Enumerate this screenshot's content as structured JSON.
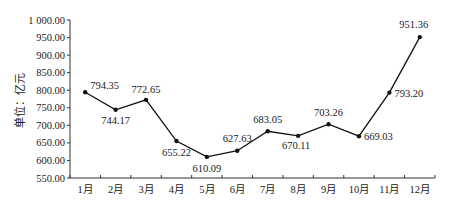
{
  "chart_data": {
    "type": "line",
    "title": "",
    "xlabel": "",
    "ylabel": "单位：亿元",
    "categories": [
      "1月",
      "2月",
      "3月",
      "4月",
      "5月",
      "6月",
      "7月",
      "8月",
      "9月",
      "10月",
      "11月",
      "12月"
    ],
    "series": [
      {
        "name": "",
        "values": [
          794.35,
          744.17,
          772.65,
          655.22,
          610.09,
          627.63,
          683.05,
          670.11,
          703.26,
          669.03,
          793.2,
          951.36
        ]
      }
    ],
    "data_labels": [
      "794.35",
      "744.17",
      "772.65",
      "655.22",
      "610.09",
      "627.63",
      "683.05",
      "670.11",
      "703.26",
      "669.03",
      "793.20",
      "951.36"
    ],
    "yticks": [
      "550.00",
      "600.00",
      "650.00",
      "700.00",
      "750.00",
      "800.00",
      "850.00",
      "900.00",
      "950.00",
      "1 000.00"
    ],
    "ylim": [
      550,
      1000
    ],
    "grid": false,
    "legend": "none",
    "colors": {
      "line": "#111111",
      "axis": "#333333"
    }
  }
}
